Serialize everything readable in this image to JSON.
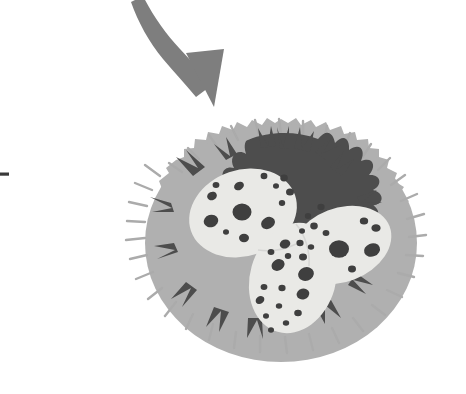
{
  "figure": {
    "description": "Schematic drawing of a granulocyte (white blood cell) with a spiky light-gray cytoplasm, dark-gray granular interior and a pale multi-lobed nucleus speckled with dark granules. A curved gray arrow points down-right toward the cell.",
    "background_color": "#ffffff",
    "width": 466,
    "height": 394
  },
  "palette": {
    "background": "#ffffff",
    "arrow_gray": "#7e7e7e",
    "cytoplasm_light_gray": "#b0b0b0",
    "cytoplasm_edge_gray": "#a8a8a8",
    "granular_dark_gray": "#4d4d4d",
    "nucleus_pale": "#e9e9e6",
    "nucleus_shade": "#dedede",
    "granule_dark": "#3f3f3f",
    "tick_mark_dark": "#3a3a3a"
  },
  "elements": {
    "arrow": {
      "name": "Curved pointer arrow",
      "style": "curved tapering arrow with solid triangular head",
      "color": "#7e7e7e",
      "start_point": [
        143,
        0
      ],
      "tip_point": [
        214,
        106
      ],
      "direction": "down-right"
    },
    "tick_mark": {
      "name": "Leader line tick at left margin",
      "color": "#3a3a3a",
      "x": 0,
      "y": 173,
      "width": 9,
      "height": 3
    },
    "cell": {
      "name": "Granulocyte",
      "center": [
        281,
        243
      ],
      "radius_x": 142,
      "radius_y": 124,
      "bounds": [
        138,
        118,
        424,
        367
      ],
      "cytoplasm_color": "#b0b0b0",
      "has_spiky_membrane": true,
      "granular_region_color": "#4d4d4d",
      "nucleus_lobe_count": 3,
      "nucleus_color": "#e9e9e6",
      "granule_color": "#3f3f3f",
      "granule_count": 40
    }
  },
  "labels": {
    "arrow_label": "",
    "cell_label": ""
  }
}
